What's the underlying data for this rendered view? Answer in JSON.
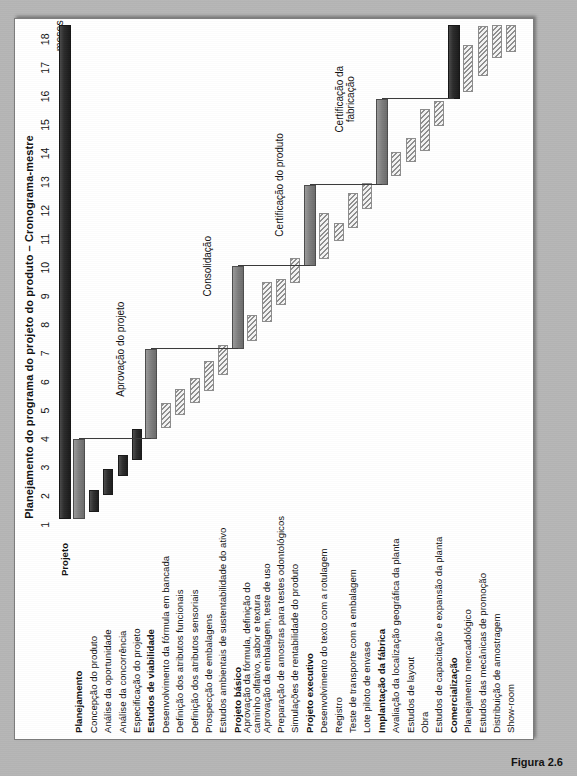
{
  "caption": "Figura 2.6",
  "chart_title": "Planejamento do programa do projeto do produto – Cronograma-mestre",
  "axis": {
    "unit_label": "meses",
    "ticks": [
      "1",
      "2",
      "3",
      "4",
      "5",
      "6",
      "7",
      "8",
      "9",
      "10",
      "11",
      "12",
      "13",
      "14",
      "15",
      "16",
      "17",
      "18"
    ]
  },
  "milestones": [
    {
      "label": "Aprovação do projeto"
    },
    {
      "label": "Consolidação"
    },
    {
      "label": "Certificação do produto"
    },
    {
      "label": "Certificação da fabricação"
    }
  ],
  "chart_data": {
    "type": "bar",
    "title": "Planejamento do programa do projeto do produto – Cronograma-mestre",
    "xlabel": "meses",
    "ylabel": "",
    "xlim": [
      0,
      18
    ],
    "grid": false,
    "legend": "none",
    "categories": [
      "Projeto",
      "Planejamento",
      "Concepção do produto",
      "Análise da oportunidade",
      "Análise da concorrência",
      "Especificação do projeto",
      "Estudos de viabilidade",
      "Desenvolvimento da fórmula em bancada",
      "Definição dos atributos funcionais",
      "Definição dos atributos sensoriais",
      "Prospecção de embalagens",
      "Estudos ambientais de sustentabilidade do ativo",
      "Projeto básico",
      "Aprovação da fórmula, definição do caminho olfativo, sabor e textura",
      "Aprovação da embalagem, teste de uso",
      "Preparação de amostras para testes odontológicos",
      "Simulações de rentabilidade do produto",
      "Projeto executivo",
      "Desenvolvimento do texto com a rotulagem",
      "Registro",
      "Teste de transporte com a embalagem",
      "Lote piloto de envase",
      "Implantação da fábrica",
      "Avaliação da localização geográfica da planta",
      "Estudos de layout",
      "Obra",
      "Estudos de capacitação e expansão da planta",
      "Comercialização",
      "Planejamento mercadológico",
      "Estudos das mecânicas de promoção",
      "Distribuição de amostragem",
      "Show-room"
    ],
    "tasks": [
      {
        "name": "Projeto",
        "start": 0.7,
        "end": 18.0,
        "kind": "summary-black",
        "bold": true
      },
      {
        "name": "Planejamento",
        "start": 0.7,
        "end": 3.5,
        "kind": "summary-gray",
        "bold": true
      },
      {
        "name": "Concepção do produto",
        "start": 0.95,
        "end": 1.7,
        "kind": "dark"
      },
      {
        "name": "Análise da oportunidade",
        "start": 1.55,
        "end": 2.45,
        "kind": "dark"
      },
      {
        "name": "Análise da concorrência",
        "start": 2.2,
        "end": 2.95,
        "kind": "dark"
      },
      {
        "name": "Especificação do projeto",
        "start": 2.75,
        "end": 3.85,
        "kind": "dark"
      },
      {
        "name": "Estudos de viabilidade",
        "start": 3.5,
        "end": 6.65,
        "kind": "summary-gray",
        "bold": true
      },
      {
        "name": "Desenvolvimento da fórmula em bancada",
        "start": 3.9,
        "end": 4.75,
        "kind": "hatch"
      },
      {
        "name": "Definição dos atributos funcionais",
        "start": 4.35,
        "end": 5.25,
        "kind": "hatch"
      },
      {
        "name": "Definição dos atributos sensoriais",
        "start": 4.75,
        "end": 5.65,
        "kind": "hatch"
      },
      {
        "name": "Prospecção de embalagens",
        "start": 5.2,
        "end": 6.25,
        "kind": "hatch"
      },
      {
        "name": "Estudos ambientais de sustentabilidade do ativo",
        "start": 5.75,
        "end": 6.8,
        "kind": "hatch"
      },
      {
        "name": "Projeto básico",
        "start": 6.65,
        "end": 9.55,
        "kind": "summary-gray",
        "bold": true
      },
      {
        "name": "Aprovação da fórmula, definição do caminho olfativo, sabor e textura",
        "start": 6.95,
        "end": 7.85,
        "kind": "hatch"
      },
      {
        "name": "Aprovação da embalagem, teste de uso",
        "start": 7.6,
        "end": 9.0,
        "kind": "hatch"
      },
      {
        "name": "Preparação de amostras para testes odontológicos",
        "start": 8.2,
        "end": 9.1,
        "kind": "hatch"
      },
      {
        "name": "Simulações de rentabilidade do produto",
        "start": 8.95,
        "end": 9.85,
        "kind": "hatch"
      },
      {
        "name": "Projeto executivo",
        "start": 9.55,
        "end": 12.4,
        "kind": "summary-gray",
        "bold": true
      },
      {
        "name": "Desenvolvimento do texto com a rotulagem",
        "start": 9.8,
        "end": 11.4,
        "kind": "hatch"
      },
      {
        "name": "Registro",
        "start": 10.45,
        "end": 11.05,
        "kind": "hatch"
      },
      {
        "name": "Teste de transporte com a embalagem",
        "start": 10.9,
        "end": 12.1,
        "kind": "hatch"
      },
      {
        "name": "Lote piloto de envase",
        "start": 11.55,
        "end": 12.45,
        "kind": "hatch"
      },
      {
        "name": "Implantação da fábrica",
        "start": 12.4,
        "end": 15.4,
        "kind": "summary-gray",
        "bold": true
      },
      {
        "name": "Avaliação da localização geográfica da planta",
        "start": 12.7,
        "end": 13.55,
        "kind": "hatch"
      },
      {
        "name": "Estudos de layout",
        "start": 13.2,
        "end": 14.05,
        "kind": "hatch"
      },
      {
        "name": "Obra",
        "start": 13.6,
        "end": 15.05,
        "kind": "hatch"
      },
      {
        "name": "Estudos de capacitação e expansão da planta",
        "start": 14.45,
        "end": 15.35,
        "kind": "hatch"
      },
      {
        "name": "Comercialização",
        "start": 15.4,
        "end": 18.0,
        "kind": "summary-black",
        "bold": true
      },
      {
        "name": "Planejamento mercadológico",
        "start": 15.65,
        "end": 17.3,
        "kind": "hatch"
      },
      {
        "name": "Estudos das mecânicas de promoção",
        "start": 16.2,
        "end": 17.95,
        "kind": "hatch"
      },
      {
        "name": "Distribuição de amostragem",
        "start": 16.85,
        "end": 18.0,
        "kind": "hatch"
      },
      {
        "name": "Show-room",
        "start": 17.05,
        "end": 18.0,
        "kind": "hatch"
      }
    ]
  }
}
